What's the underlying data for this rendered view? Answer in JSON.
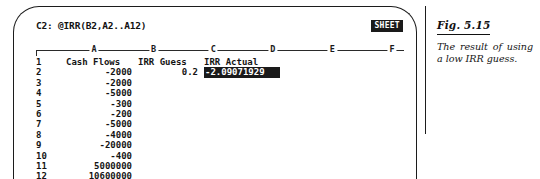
{
  "screen": {
    "formula_line": "C2: @IRR(B2,A2..A12)",
    "mode_badge": "SHEET",
    "column_letters": [
      "A",
      "B",
      "C",
      "D",
      "E",
      "F"
    ],
    "columns": {
      "row_header": "",
      "a": "Cash Flows",
      "b": "IRR Guess",
      "c": "IRR Actual"
    },
    "rows": [
      {
        "num": "1",
        "a": "Cash Flows",
        "b": "IRR Guess",
        "c": "IRR Actual",
        "header": true,
        "c_selected": false
      },
      {
        "num": "2",
        "a": "-2000",
        "b": "0.2",
        "c": "-2.09071929",
        "header": false,
        "c_selected": true
      },
      {
        "num": "3",
        "a": "-2000",
        "b": "",
        "c": "",
        "header": false,
        "c_selected": false
      },
      {
        "num": "4",
        "a": "-5000",
        "b": "",
        "c": "",
        "header": false,
        "c_selected": false
      },
      {
        "num": "5",
        "a": "-300",
        "b": "",
        "c": "",
        "header": false,
        "c_selected": false
      },
      {
        "num": "6",
        "a": "-200",
        "b": "",
        "c": "",
        "header": false,
        "c_selected": false
      },
      {
        "num": "7",
        "a": "-5000",
        "b": "",
        "c": "",
        "header": false,
        "c_selected": false
      },
      {
        "num": "8",
        "a": "-4000",
        "b": "",
        "c": "",
        "header": false,
        "c_selected": false
      },
      {
        "num": "9",
        "a": "-20000",
        "b": "",
        "c": "",
        "header": false,
        "c_selected": false
      },
      {
        "num": "10",
        "a": "-400",
        "b": "",
        "c": "",
        "header": false,
        "c_selected": false
      },
      {
        "num": "11",
        "a": "5000000",
        "b": "",
        "c": "",
        "header": false,
        "c_selected": false
      },
      {
        "num": "12",
        "a": "10600000",
        "b": "",
        "c": "",
        "header": false,
        "c_selected": false
      }
    ]
  },
  "caption": {
    "figure_number": "Fig. 5.15",
    "text": "The result of using a low IRR guess."
  },
  "colors": {
    "ink": "#1a1a1a",
    "paper": "#ffffff",
    "inverse_text": "#ffffff"
  }
}
